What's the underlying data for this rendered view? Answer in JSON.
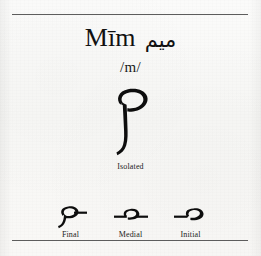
{
  "page": {
    "background_color": "#f7f7f5",
    "ink_color": "#0d0d0d",
    "rule_color": "#5d5d5d"
  },
  "header": {
    "title_latin": "Mīm",
    "title_arabic": "ميم",
    "phoneme": "/m/"
  },
  "isolated": {
    "glyph": "م",
    "caption": "Isolated"
  },
  "forms": [
    {
      "label": "Final",
      "glyph": "ـم",
      "icon": "meem-final-glyph"
    },
    {
      "label": "Medial",
      "glyph": "ـمـ",
      "icon": "meem-medial-glyph"
    },
    {
      "label": "Initial",
      "glyph": "مـ",
      "icon": "meem-initial-glyph"
    }
  ]
}
